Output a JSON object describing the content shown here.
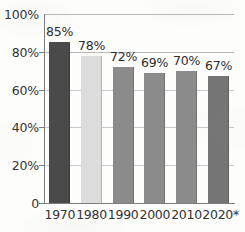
{
  "chart_data": {
    "type": "bar",
    "title": "",
    "subtitle": "",
    "xlabel": "",
    "ylabel": "",
    "categories": [
      "1970",
      "1980",
      "1990",
      "2000",
      "2010",
      "2020*"
    ],
    "values": [
      85,
      78,
      72,
      69,
      70,
      67
    ],
    "data_labels": [
      "85%",
      "78%",
      "72%",
      "69%",
      "70%",
      "67%"
    ],
    "ylim": [
      0,
      100
    ],
    "ytick_values": [
      100,
      80,
      60,
      40,
      20,
      0
    ],
    "ytick_labels": [
      "100%",
      "80%",
      "60%",
      "40%",
      "20%",
      "0"
    ],
    "grid": true,
    "grid_axis": "y",
    "legend": false,
    "legend_position": "none",
    "bar_colors": [
      "#4a4a4a",
      "#dcdcdc",
      "#8b8b8b",
      "#8b8b8b",
      "#8b8b8b",
      "#757575"
    ],
    "annotations": []
  },
  "style": {
    "background": "#fdfdfc",
    "grid_color": "#b9b9b9",
    "axis_color": "#7d7d7d",
    "tick_text_color": "#333333",
    "label_text_color": "#2d2d2d"
  }
}
